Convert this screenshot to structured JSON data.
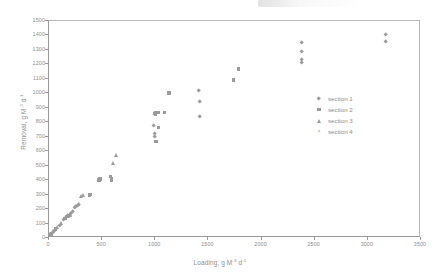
{
  "chart_data": {
    "type": "scatter",
    "title": "",
    "xlabel": "Loading, g M-3 d-1",
    "ylabel": "Removal, g M-3 d-1",
    "xlabel_parts": {
      "prefix": "Loading, g M",
      "sup1": "-3",
      "mid": " d",
      "sup2": "-1"
    },
    "ylabel_parts": {
      "prefix": "Removal, g M",
      "sup1": "-3",
      "mid": " d",
      "sup2": "-1"
    },
    "xlim": [
      0,
      3500
    ],
    "ylim": [
      0,
      1500
    ],
    "xticks": [
      0,
      500,
      1000,
      1500,
      2000,
      2500,
      3000,
      3500
    ],
    "yticks": [
      0,
      100,
      200,
      300,
      400,
      500,
      600,
      700,
      800,
      900,
      1000,
      1100,
      1200,
      1300,
      1400,
      1500
    ],
    "grid": false,
    "legend_position": "inside-right",
    "marker_color": "#9b9b9b",
    "series": [
      {
        "name": "section 1",
        "marker": "diamond",
        "points": [
          [
            20,
            15
          ],
          [
            40,
            30
          ],
          [
            60,
            45
          ],
          [
            110,
            80
          ],
          [
            150,
            120
          ],
          [
            170,
            135
          ],
          [
            185,
            145
          ],
          [
            200,
            150
          ],
          [
            215,
            160
          ],
          [
            230,
            175
          ],
          [
            250,
            200
          ],
          [
            260,
            210
          ],
          [
            275,
            215
          ],
          [
            290,
            225
          ],
          [
            990,
            770
          ],
          [
            1000,
            715
          ],
          [
            1000,
            690
          ],
          [
            1420,
            1010
          ],
          [
            1430,
            935
          ],
          [
            1430,
            835
          ],
          [
            2390,
            1345
          ],
          [
            2390,
            1280
          ],
          [
            2385,
            1225
          ],
          [
            2390,
            1205
          ],
          [
            3175,
            1400
          ],
          [
            3180,
            1350
          ]
        ]
      },
      {
        "name": "section 2",
        "marker": "square",
        "points": [
          [
            30,
            20
          ],
          [
            70,
            55
          ],
          [
            160,
            130
          ],
          [
            175,
            140
          ],
          [
            195,
            150
          ],
          [
            390,
            290
          ],
          [
            400,
            295
          ],
          [
            480,
            395
          ],
          [
            490,
            400
          ],
          [
            590,
            420
          ],
          [
            595,
            405
          ],
          [
            600,
            395
          ],
          [
            1000,
            855
          ],
          [
            1010,
            850
          ],
          [
            1015,
            860
          ],
          [
            1015,
            660
          ],
          [
            1040,
            755
          ],
          [
            1040,
            860
          ],
          [
            1095,
            860
          ],
          [
            1140,
            995
          ],
          [
            1745,
            1085
          ],
          [
            1790,
            1160
          ]
        ]
      },
      {
        "name": "section 3",
        "marker": "triangle",
        "points": [
          [
            25,
            18
          ],
          [
            50,
            40
          ],
          [
            90,
            70
          ],
          [
            120,
            95
          ],
          [
            180,
            145
          ],
          [
            190,
            148
          ],
          [
            205,
            155
          ],
          [
            310,
            280
          ],
          [
            330,
            290
          ],
          [
            615,
            510
          ],
          [
            640,
            570
          ]
        ]
      },
      {
        "name": "section 4",
        "marker": "cross",
        "points": [
          [
            10,
            5
          ]
        ]
      }
    ],
    "legend_entries": [
      {
        "label": "section 1",
        "marker": "diamond"
      },
      {
        "label": "section 2",
        "marker": "square"
      },
      {
        "label": "section 3",
        "marker": "triangle"
      },
      {
        "label": "section 4",
        "marker": "cross"
      }
    ]
  }
}
